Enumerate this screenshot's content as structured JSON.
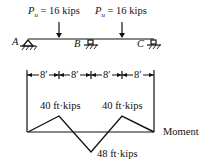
{
  "loads": [
    {
      "symbol": "P",
      "subscript": "u",
      "value": "= 16 kips"
    },
    {
      "symbol": "P",
      "subscript": "u",
      "value": "= 16 kips"
    }
  ],
  "supports": [
    "A",
    "B",
    "C"
  ],
  "spans": [
    "8′",
    "8′",
    "8′",
    "8′"
  ],
  "moment": {
    "label": "Moment",
    "peak_left": "40 ft·kips",
    "peak_right": "40 ft·kips",
    "negative": "48 ft·kips"
  }
}
